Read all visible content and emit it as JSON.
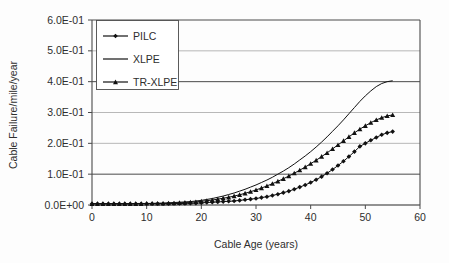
{
  "chart_data": {
    "type": "line",
    "title": "",
    "xlabel": "Cable Age (years)",
    "ylabel": "Cable Failure/mile/year",
    "xlim": [
      0,
      60
    ],
    "ylim": [
      0,
      0.6
    ],
    "grid": true,
    "legend_position": "top-left",
    "xticks": [
      "0",
      "10",
      "20",
      "30",
      "40",
      "50",
      "60"
    ],
    "xtick_values": [
      0,
      10,
      20,
      30,
      40,
      50,
      60
    ],
    "yticks": [
      "0.0E+00",
      "1.0E-01",
      "2.0E-01",
      "3.0E-01",
      "4.0E-01",
      "5.0E-01",
      "6.0E-01"
    ],
    "ytick_values": [
      0.0,
      0.1,
      0.2,
      0.3,
      0.4,
      0.5,
      0.6
    ],
    "x": [
      0,
      1,
      2,
      3,
      4,
      5,
      6,
      7,
      8,
      9,
      10,
      11,
      12,
      13,
      14,
      15,
      16,
      17,
      18,
      19,
      20,
      21,
      22,
      23,
      24,
      25,
      26,
      27,
      28,
      29,
      30,
      31,
      32,
      33,
      34,
      35,
      36,
      37,
      38,
      39,
      40,
      41,
      42,
      43,
      44,
      45,
      46,
      47,
      48,
      49,
      50,
      51,
      52,
      53,
      54,
      55
    ],
    "series": [
      {
        "name": "PILC",
        "marker": "diamond",
        "color": "#111111",
        "values": [
          0.004,
          0.004,
          0.004,
          0.004,
          0.004,
          0.004,
          0.004,
          0.004,
          0.004,
          0.004,
          0.004,
          0.004,
          0.004,
          0.004,
          0.004,
          0.005,
          0.005,
          0.005,
          0.006,
          0.006,
          0.007,
          0.008,
          0.009,
          0.01,
          0.011,
          0.012,
          0.013,
          0.015,
          0.017,
          0.019,
          0.021,
          0.024,
          0.027,
          0.031,
          0.035,
          0.04,
          0.045,
          0.051,
          0.058,
          0.065,
          0.073,
          0.082,
          0.092,
          0.103,
          0.115,
          0.128,
          0.142,
          0.157,
          0.173,
          0.19,
          0.2,
          0.21,
          0.219,
          0.228,
          0.234,
          0.238
        ]
      },
      {
        "name": "XLPE",
        "marker": "none",
        "color": "#111111",
        "values": [
          0.004,
          0.004,
          0.004,
          0.004,
          0.004,
          0.004,
          0.004,
          0.004,
          0.005,
          0.005,
          0.005,
          0.005,
          0.006,
          0.006,
          0.007,
          0.008,
          0.009,
          0.01,
          0.011,
          0.013,
          0.015,
          0.018,
          0.021,
          0.025,
          0.029,
          0.034,
          0.039,
          0.045,
          0.051,
          0.058,
          0.065,
          0.073,
          0.081,
          0.09,
          0.1,
          0.11,
          0.121,
          0.133,
          0.146,
          0.159,
          0.173,
          0.188,
          0.204,
          0.221,
          0.239,
          0.257,
          0.276,
          0.296,
          0.316,
          0.336,
          0.354,
          0.37,
          0.384,
          0.394,
          0.4,
          0.403
        ]
      },
      {
        "name": "TR-XLPE",
        "marker": "triangle",
        "color": "#111111",
        "values": [
          0.004,
          0.004,
          0.004,
          0.004,
          0.004,
          0.004,
          0.004,
          0.004,
          0.004,
          0.004,
          0.005,
          0.005,
          0.005,
          0.005,
          0.006,
          0.006,
          0.007,
          0.008,
          0.009,
          0.01,
          0.012,
          0.014,
          0.016,
          0.019,
          0.022,
          0.025,
          0.029,
          0.033,
          0.038,
          0.043,
          0.049,
          0.055,
          0.062,
          0.069,
          0.077,
          0.085,
          0.094,
          0.103,
          0.113,
          0.123,
          0.134,
          0.145,
          0.157,
          0.169,
          0.182,
          0.195,
          0.208,
          0.221,
          0.234,
          0.246,
          0.257,
          0.267,
          0.276,
          0.283,
          0.289,
          0.292
        ]
      }
    ],
    "legend_entries": [
      "PILC",
      "XLPE",
      "TR-XLPE"
    ]
  }
}
